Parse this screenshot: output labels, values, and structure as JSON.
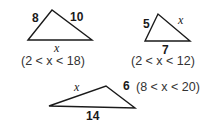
{
  "diagram": {
    "triangles": [
      {
        "id": "triangle-1",
        "sides": {
          "left": "8",
          "right": "10",
          "base": "x"
        },
        "range": "(2 < x < 18)"
      },
      {
        "id": "triangle-2",
        "sides": {
          "left": "5",
          "right": "x",
          "base": "7"
        },
        "range": "(2 < x < 12)"
      },
      {
        "id": "triangle-3",
        "sides": {
          "left": "x",
          "right": "6",
          "base": "14"
        },
        "range": "(8 < x < 20)"
      }
    ],
    "colors": {
      "stroke": "#1a1a1a",
      "text": "#1a1a1a",
      "range_text": "#333333",
      "background": "#ffffff"
    }
  }
}
